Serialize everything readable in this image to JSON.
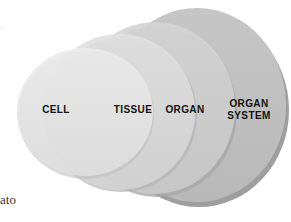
{
  "diagram": {
    "type": "nested-circles",
    "title": "",
    "levels": [
      {
        "id": "cell",
        "label": "CELL"
      },
      {
        "id": "tissue",
        "label": "TISSUE"
      },
      {
        "id": "organ",
        "label": "ORGAN"
      },
      {
        "id": "organ_system",
        "label_line1": "ORGAN",
        "label_line2": "SYSTEM"
      }
    ],
    "colors": {
      "cell": "#e6e6e6",
      "tissue": "#dcdcdc",
      "organ": "#cfcfcf",
      "organ_system": "#bdbdbd",
      "shadow": "#9a9a9a"
    }
  },
  "edge_text": {
    "bottom_left": "ato",
    "top_left_mark": "·"
  }
}
